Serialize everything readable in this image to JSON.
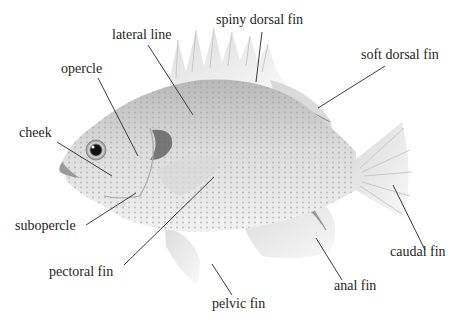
{
  "figure": {
    "labels": {
      "lateral_line": "lateral line",
      "spiny_dorsal_fin": "spiny dorsal fin",
      "soft_dorsal_fin": "soft dorsal fin",
      "opercle": "opercle",
      "cheek": "cheek",
      "subopercle": "subopercle",
      "pectoral_fin": "pectoral fin",
      "pelvic_fin": "pelvic fin",
      "anal_fin": "anal fin",
      "caudal_fin": "caudal fin"
    }
  },
  "colors": {
    "text": "#231f20",
    "leader_line": "#3a3a3a",
    "body_light": "#e9e9e9",
    "body_mid": "#bdbdbd",
    "body_dark": "#7a7a7a",
    "background": "#ffffff"
  }
}
